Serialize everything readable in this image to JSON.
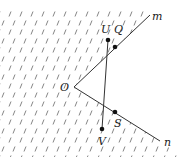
{
  "diagram": {
    "type": "geometry",
    "vertex": {
      "name": "O",
      "label": "O",
      "x": 74,
      "y": 87,
      "label_x": 60,
      "label_y": 91
    },
    "rays": [
      {
        "name": "m",
        "label": "m",
        "from": [
          74,
          87
        ],
        "to": [
          150,
          15
        ],
        "label_x": 152,
        "label_y": 20
      },
      {
        "name": "n",
        "label": "n",
        "from": [
          74,
          87
        ],
        "to": [
          160,
          141
        ],
        "label_x": 164,
        "label_y": 146
      }
    ],
    "points": [
      {
        "name": "U",
        "label": "U",
        "x": 108,
        "y": 40,
        "label_x": 101,
        "label_y": 33
      },
      {
        "name": "Q",
        "label": "Q",
        "x": 115,
        "y": 47,
        "label_x": 114,
        "label_y": 33
      },
      {
        "name": "S",
        "label": "S",
        "x": 115,
        "y": 112,
        "label_x": 114,
        "label_y": 127
      },
      {
        "name": "V",
        "label": "V",
        "x": 102,
        "y": 129,
        "label_x": 98,
        "label_y": 145
      }
    ],
    "segments": [
      {
        "name": "UV",
        "from": "U",
        "to": "V"
      }
    ],
    "colors": {
      "line": "#333333",
      "hatch": "#666666",
      "point": "#111111",
      "background": "#ffffff"
    }
  }
}
